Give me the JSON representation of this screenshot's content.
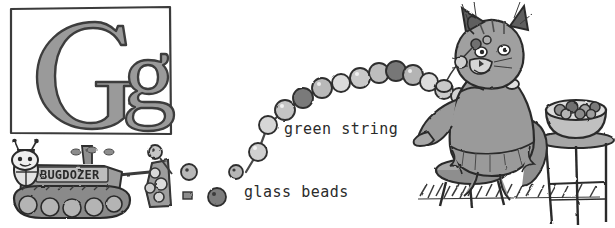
{
  "page": {
    "kind": "alphabet-picture-illustration",
    "letter_card": {
      "name": "letter-card-g",
      "uppercase": "G",
      "lowercase": "g",
      "combined": "Gg",
      "border_color": "#3a3a3a",
      "letter_fill": "#9a9a9a",
      "letter_outline": "#3c3c3c",
      "background": "#ffffff"
    },
    "labels": [
      {
        "name": "green-string",
        "text": "green string"
      },
      {
        "name": "glass-beads",
        "text": "glass beads"
      }
    ],
    "vehicle": {
      "name": "bulldozer",
      "body_text": "BUGDOZER"
    },
    "characters": [
      {
        "name": "bug-driver",
        "description": "bug driving the bulldozer"
      },
      {
        "name": "cat",
        "description": "cat threading glass beads onto a green string"
      }
    ],
    "props": [
      {
        "name": "stool",
        "description": "round wooden stool"
      },
      {
        "name": "tall-stool",
        "description": "tall stool holding the bead bowl"
      },
      {
        "name": "bead-bowl",
        "description": "bowl full of glass beads"
      },
      {
        "name": "grass",
        "description": "hatched grass ground line"
      }
    ],
    "palette": {
      "ink": "#2b2b2b",
      "mid_gray": "#8d8d8d",
      "light_gray": "#c9c9c9",
      "dark_gray": "#5d5d5d",
      "paper": "#ffffff"
    }
  },
  "beads": {
    "string_color": "#4a4a4a",
    "loose": [
      {
        "cx": 155,
        "cy": 152,
        "r": 7,
        "tone": "#c6c6c6"
      },
      {
        "cx": 189,
        "cy": 172,
        "r": 8,
        "tone": "#b2b2b2"
      },
      {
        "cx": 217,
        "cy": 197,
        "r": 9,
        "tone": "#7d7d7d"
      },
      {
        "cx": 236,
        "cy": 173,
        "r": 7,
        "tone": "#b6b6b6"
      },
      {
        "cx": 156,
        "cy": 152,
        "r": 6,
        "tone": "#d0d0d0"
      }
    ],
    "strand": [
      {
        "cx": 258,
        "cy": 152,
        "r": 9,
        "tone": "#cfcfcf"
      },
      {
        "cx": 268,
        "cy": 125,
        "r": 9,
        "tone": "#d6d6d6"
      },
      {
        "cx": 285,
        "cy": 110,
        "r": 10,
        "tone": "#c4c4c4"
      },
      {
        "cx": 303,
        "cy": 98,
        "r": 10,
        "tone": "#7a7a7a"
      },
      {
        "cx": 322,
        "cy": 88,
        "r": 10,
        "tone": "#b9b9b9"
      },
      {
        "cx": 341,
        "cy": 83,
        "r": 9,
        "tone": "#dcdcdc"
      },
      {
        "cx": 360,
        "cy": 78,
        "r": 10,
        "tone": "#c9c9c9"
      },
      {
        "cx": 379,
        "cy": 73,
        "r": 10,
        "tone": "#bdbdbd"
      },
      {
        "cx": 396,
        "cy": 71,
        "r": 10,
        "tone": "#777777"
      },
      {
        "cx": 413,
        "cy": 75,
        "r": 10,
        "tone": "#b4b4b4"
      },
      {
        "cx": 429,
        "cy": 82,
        "r": 9,
        "tone": "#dddddd"
      },
      {
        "cx": 444,
        "cy": 90,
        "r": 9,
        "tone": "#cacaca"
      },
      {
        "cx": 459,
        "cy": 96,
        "r": 8,
        "tone": "#d2d2d2"
      },
      {
        "cx": 474,
        "cy": 98,
        "r": 8,
        "tone": "#bebebe"
      }
    ]
  }
}
